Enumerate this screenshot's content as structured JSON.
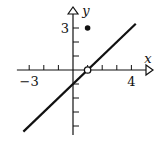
{
  "chart_data": {
    "type": "line",
    "title": "",
    "xlabel": "x",
    "ylabel": "y",
    "xlim": [
      -3.5,
      5.3
    ],
    "ylim": [
      -4.5,
      4.1
    ],
    "x_tick_labels": [
      {
        "value": -3,
        "label": "−3"
      },
      {
        "value": 4,
        "label": "4"
      }
    ],
    "y_tick_labels": [
      {
        "value": 3,
        "label": "3"
      }
    ],
    "x_ticks": [
      -3,
      -2,
      -1,
      1,
      2,
      3,
      4
    ],
    "y_ticks": [
      -4,
      -3,
      -2,
      -1,
      1,
      2,
      3
    ],
    "grid": false,
    "series": [
      {
        "name": "y = x - 1",
        "x": [
          -3.4,
          4.3
        ],
        "y": [
          -4.4,
          3.3
        ]
      }
    ],
    "open_points": [
      {
        "x": 1,
        "y": 0
      }
    ],
    "closed_points": [
      {
        "x": 1,
        "y": 3
      }
    ],
    "colors": {
      "ink": "#111111",
      "background": "#ffffff"
    }
  }
}
